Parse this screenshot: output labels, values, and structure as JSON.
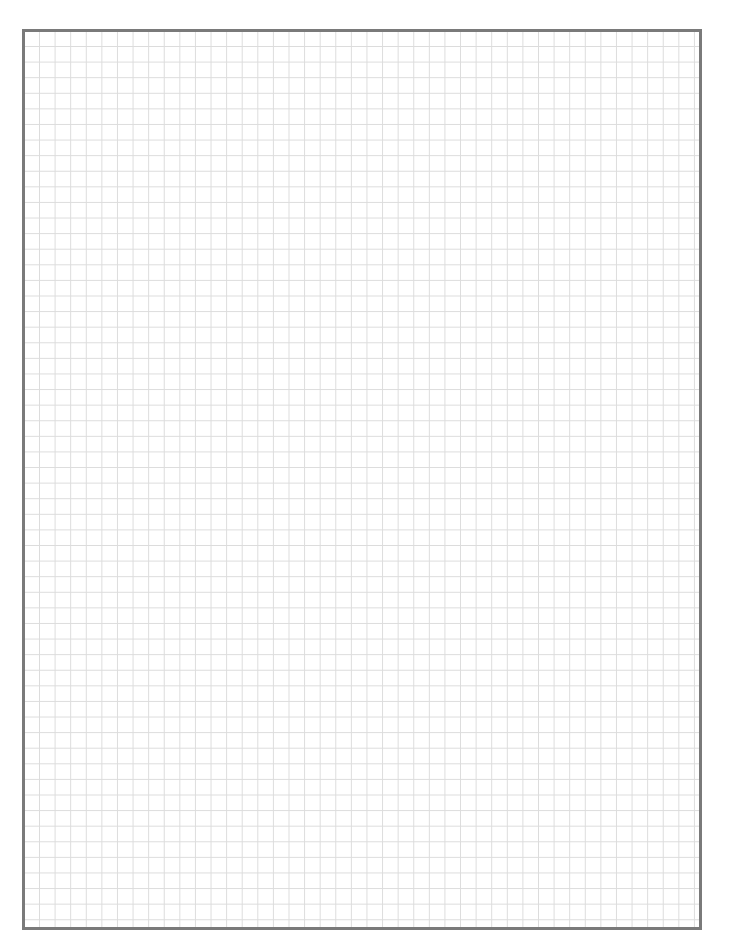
{
  "page": {
    "type": "graph-paper",
    "grid": {
      "cell_size_px": 15.6,
      "line_color": "#dcdcdc",
      "columns_approx": 43,
      "rows_approx": 57
    },
    "border": {
      "color": "#7a7a7a",
      "width_px": 3
    },
    "background": "#ffffff"
  }
}
